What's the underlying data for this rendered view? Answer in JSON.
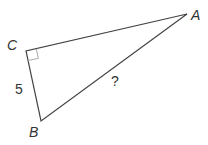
{
  "diagram": {
    "type": "right-triangle",
    "vertices": {
      "A": {
        "label": "A",
        "x": 187,
        "y": 14
      },
      "B": {
        "label": "B",
        "x": 41,
        "y": 121
      },
      "C": {
        "label": "C",
        "x": 26,
        "y": 51
      }
    },
    "right_angle_at": "C",
    "side_labels": {
      "BC": "5",
      "AB": "?"
    },
    "colors": {
      "stroke": "#444444",
      "right_angle_marker": "#aaaaaa",
      "text": "#333333"
    }
  }
}
